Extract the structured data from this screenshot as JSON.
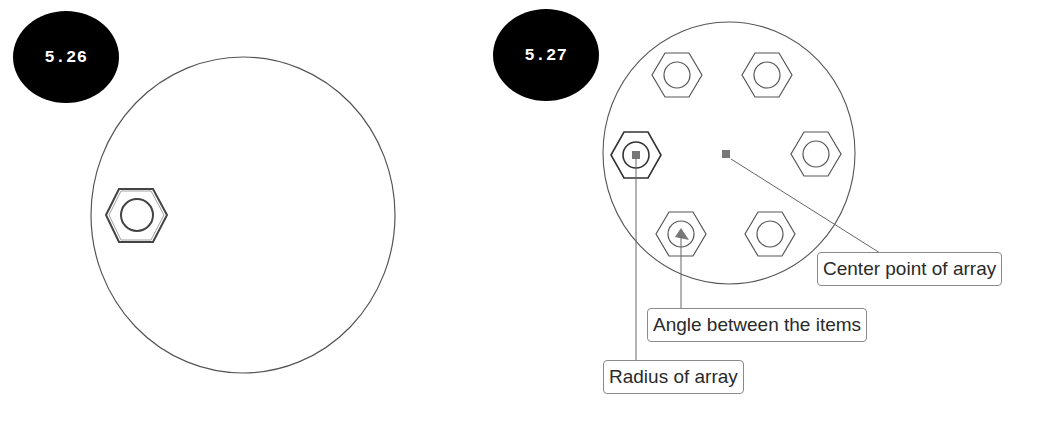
{
  "figures": [
    {
      "id": "fig-5-26",
      "badge_label": "5.26",
      "description": "Circle plate with a single hex nut placed on the left side"
    },
    {
      "id": "fig-5-27",
      "badge_label": "5.27",
      "description": "Polar array of six hex nuts around a center point",
      "item_count": 6,
      "callouts": {
        "center_point": "Center point of array",
        "angle": "Angle between the items",
        "radius": "Radius of array"
      }
    }
  ],
  "colors": {
    "badge_bg": "#000000",
    "badge_text": "#ffffff",
    "line": "#555555",
    "callout_border": "#8a8a8a",
    "marker": "#777777"
  }
}
